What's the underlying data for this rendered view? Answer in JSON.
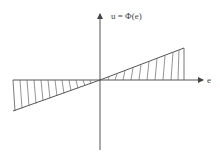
{
  "diagram": {
    "y_axis_label": "u = Φ(e)",
    "x_axis_label": "e",
    "colors": {
      "stroke": "#555555",
      "background": "#ffffff"
    },
    "origin": [
      100,
      80
    ],
    "regions": [
      {
        "name": "left",
        "x_range": [
          13,
          100
        ],
        "lower_edge_at_left": 111
      },
      {
        "name": "right",
        "x_range": [
          100,
          184
        ],
        "upper_edge_at_right": 48
      }
    ]
  }
}
